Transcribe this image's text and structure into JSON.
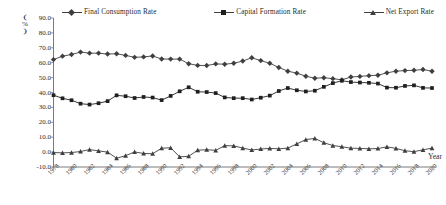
{
  "chart_data": {
    "type": "line",
    "title": "",
    "xlabel": "Year",
    "ylabel": "(%)",
    "ylim": [
      -10.0,
      90.0
    ],
    "ytick_labels": [
      "90.0",
      "80.0",
      "70.0",
      "60.0",
      "50.0",
      "40.0",
      "30.0",
      "20.0",
      "10.0",
      "0.0",
      "-10.0"
    ],
    "ytick_values": [
      90.0,
      80.0,
      70.0,
      60.0,
      50.0,
      40.0,
      30.0,
      20.0,
      10.0,
      0.0,
      -10.0
    ],
    "grid": false,
    "legend_position": "top",
    "x": [
      1978,
      1979,
      1980,
      1981,
      1982,
      1983,
      1984,
      1985,
      1986,
      1987,
      1988,
      1989,
      1990,
      1991,
      1992,
      1993,
      1994,
      1995,
      1996,
      1997,
      1998,
      1999,
      2000,
      2001,
      2002,
      2003,
      2004,
      2005,
      2006,
      2007,
      2008,
      2009,
      2010,
      2011,
      2012,
      2013,
      2014,
      2015,
      2016,
      2017,
      2018,
      2019,
      2020
    ],
    "xtick_labels": [
      "1978",
      "1980",
      "1982",
      "1984",
      "1986",
      "1988",
      "1990",
      "1992",
      "1994",
      "1996",
      "1998",
      "2000",
      "2002",
      "2004",
      "2006",
      "2008",
      "2010",
      "2012",
      "2014",
      "2016",
      "2018",
      "2020"
    ],
    "series": [
      {
        "name": "Final Consumption Rate",
        "marker": "diamond",
        "color": "#3f3f3f",
        "values": [
          62.1,
          64.4,
          65.5,
          67.1,
          66.4,
          66.4,
          65.8,
          66.0,
          64.9,
          63.6,
          63.9,
          64.5,
          62.5,
          62.4,
          62.4,
          59.3,
          58.2,
          58.1,
          59.2,
          59.0,
          59.6,
          61.1,
          63.3,
          61.4,
          59.6,
          56.8,
          54.3,
          53.0,
          50.9,
          49.6,
          49.9,
          49.3,
          48.5,
          50.4,
          50.8,
          51.3,
          51.6,
          53.2,
          54.3,
          54.7,
          54.9,
          55.4,
          54.3
        ]
      },
      {
        "name": "Capital Formation Rate",
        "marker": "square",
        "color": "#1f1f1f",
        "values": [
          38.2,
          36.1,
          34.8,
          32.5,
          31.9,
          32.8,
          34.2,
          38.1,
          37.5,
          36.3,
          37.0,
          36.6,
          34.9,
          37.7,
          40.8,
          43.5,
          40.5,
          40.3,
          39.6,
          36.7,
          36.2,
          36.2,
          35.3,
          36.5,
          37.9,
          41.0,
          43.0,
          41.5,
          40.7,
          41.2,
          43.8,
          46.3,
          47.9,
          47.0,
          46.7,
          46.5,
          46.0,
          43.3,
          43.2,
          44.4,
          44.8,
          43.1,
          43.0
        ]
      },
      {
        "name": "Net Export Rate",
        "marker": "triangle",
        "color": "#3f3f3f",
        "values": [
          -0.3,
          -0.5,
          -0.3,
          0.4,
          1.7,
          0.8,
          0.0,
          -4.1,
          -2.4,
          0.1,
          -0.9,
          -1.1,
          2.6,
          2.9,
          -3.2,
          -2.8,
          1.3,
          1.6,
          1.2,
          4.3,
          4.2,
          2.7,
          1.4,
          2.1,
          2.5,
          2.2,
          2.7,
          5.5,
          8.4,
          9.2,
          6.3,
          4.4,
          3.6,
          2.6,
          2.5,
          2.2,
          2.4,
          3.5,
          2.5,
          0.9,
          0.3,
          1.5,
          2.7
        ]
      }
    ]
  },
  "legend": {
    "items": [
      {
        "label": "Final Consumption Rate",
        "marker": "diamond"
      },
      {
        "label": "Capital Formation Rate",
        "marker": "square"
      },
      {
        "label": "Net Export Rate",
        "marker": "triangle"
      }
    ]
  },
  "axes": {
    "y_axis_label_top": "(",
    "y_axis_label_mid": "%",
    "y_axis_label_bot": ")",
    "x_axis_title": "Year"
  }
}
